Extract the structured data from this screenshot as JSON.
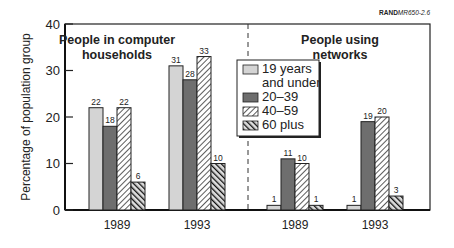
{
  "chart_data": {
    "type": "bar",
    "source_label": {
      "bold": "RAND",
      "rest": "MR650-2.6"
    },
    "ylabel": "Percentage of population group",
    "ylim": [
      0,
      40
    ],
    "yticks": [
      0,
      10,
      20,
      30,
      40
    ],
    "panels": [
      {
        "title_lines": [
          "People in computer",
          "households"
        ],
        "categories": [
          "1989",
          "1993"
        ],
        "series_values": [
          [
            22,
            31
          ],
          [
            18,
            28
          ],
          [
            22,
            33
          ],
          [
            6,
            10
          ]
        ]
      },
      {
        "title_lines": [
          "People using",
          "networks"
        ],
        "categories": [
          "1989",
          "1993"
        ],
        "series_values": [
          [
            1,
            1
          ],
          [
            11,
            19
          ],
          [
            10,
            20
          ],
          [
            1,
            3
          ]
        ]
      }
    ],
    "series": [
      {
        "name": "19 years and under",
        "legend_lines": [
          "19 years",
          "and under"
        ],
        "fill": "#d4d4d4",
        "pattern": "solid"
      },
      {
        "name": "20–39",
        "legend_lines": [
          "20–39"
        ],
        "fill": "#6e6e6e",
        "pattern": "solid"
      },
      {
        "name": "40–59",
        "legend_lines": [
          "40–59"
        ],
        "fill": "#ffffff",
        "pattern": "diagonal-light"
      },
      {
        "name": "60 plus",
        "legend_lines": [
          "60 plus"
        ],
        "fill": "#1e1e1e",
        "pattern": "diagonal-dark"
      }
    ],
    "legend_placement": "center",
    "grid": false
  }
}
